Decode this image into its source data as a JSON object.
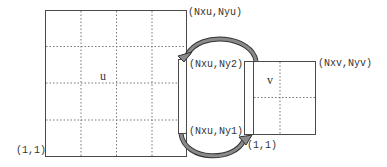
{
  "diagram": {
    "colors": {
      "line": "#4a4a4a",
      "grid_dash": "#777777",
      "arrow_fill": "#8a8a8a",
      "arrow_stroke": "#333333",
      "background": "#ffffff"
    },
    "block_u": {
      "name": "u",
      "corner_lower_left": "(1,1)",
      "corner_upper_right": "(Nxu,Nyu)",
      "strip_upper_label": "(Nxu,Ny2)",
      "strip_lower_label": "(Nxu,Ny1)",
      "grid_cols": 4,
      "grid_rows": 4
    },
    "block_v": {
      "name": "v",
      "corner_lower_left": "(1,1)",
      "corner_upper_right": "(Nxv,Nyv)",
      "grid_cols": 2,
      "grid_rows": 2
    },
    "arrows": [
      {
        "from": "block_v left strip (top)",
        "to": "block_u right ghost strip (Nxu,Ny2)",
        "direction": "v-to-u"
      },
      {
        "from": "block_u right ghost strip (Nxu,Ny1)",
        "to": "block_v (1,1)",
        "direction": "u-to-v"
      }
    ]
  }
}
